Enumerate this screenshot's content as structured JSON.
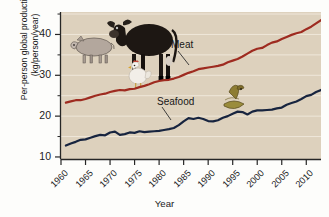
{
  "chart_data": {
    "type": "line",
    "title": "",
    "xlabel": "Year",
    "ylabel": "Per-person global production (kg/person/year)",
    "ylabel_line1": "Per-person global production",
    "ylabel_line2": "(kg/person/year)",
    "xlim": [
      1960,
      2013
    ],
    "ylim": [
      9.5,
      45.5
    ],
    "xticks": [
      1960,
      1965,
      1970,
      1975,
      1980,
      1985,
      1990,
      1995,
      2000,
      2005,
      2010
    ],
    "xtick_labels": [
      "1960",
      "1965",
      "1970",
      "1975",
      "1980",
      "1985",
      "1990",
      "1995",
      "2000",
      "2005",
      "2010"
    ],
    "yticks": [
      10,
      20,
      30,
      40
    ],
    "ytick_labels": [
      "10",
      "20",
      "30",
      "40"
    ],
    "gridlines_y": [
      15,
      20,
      25,
      30,
      35,
      40,
      45
    ],
    "grid": true,
    "legend_position": "inline-annotation",
    "plot_background": "#ddd1bd",
    "gridline_color": "#efe7da",
    "series": [
      {
        "name": "Meat",
        "color": "#9e2b20",
        "label_x": 1987,
        "label_y": 37.5,
        "x": [
          1961,
          1962,
          1963,
          1964,
          1965,
          1966,
          1967,
          1968,
          1969,
          1970,
          1971,
          1972,
          1973,
          1974,
          1975,
          1976,
          1977,
          1978,
          1979,
          1980,
          1981,
          1982,
          1983,
          1984,
          1985,
          1986,
          1987,
          1988,
          1989,
          1990,
          1991,
          1992,
          1993,
          1994,
          1995,
          1996,
          1997,
          1998,
          1999,
          2000,
          2001,
          2002,
          2003,
          2004,
          2005,
          2006,
          2007,
          2008,
          2009,
          2010,
          2011,
          2012,
          2013
        ],
        "values": [
          23.3,
          23.6,
          23.9,
          23.9,
          24.2,
          24.6,
          25.0,
          25.3,
          25.5,
          25.9,
          26.2,
          26.4,
          26.3,
          26.6,
          26.7,
          27.1,
          27.4,
          27.8,
          28.3,
          28.6,
          28.8,
          28.9,
          29.2,
          29.6,
          30.1,
          30.6,
          31.0,
          31.5,
          31.7,
          31.9,
          32.1,
          32.3,
          32.6,
          33.2,
          33.6,
          34.0,
          34.6,
          35.3,
          36.0,
          36.5,
          36.7,
          37.4,
          38.0,
          38.3,
          38.9,
          39.4,
          39.9,
          40.3,
          40.6,
          41.3,
          41.9,
          42.7,
          43.5
        ]
      },
      {
        "name": "Seafood",
        "color": "#17243f",
        "label_x": 1985,
        "label_y": 21.5,
        "x": [
          1961,
          1962,
          1963,
          1964,
          1965,
          1966,
          1967,
          1968,
          1969,
          1970,
          1971,
          1972,
          1973,
          1974,
          1975,
          1976,
          1977,
          1978,
          1979,
          1980,
          1981,
          1982,
          1983,
          1984,
          1985,
          1986,
          1987,
          1988,
          1989,
          1990,
          1991,
          1992,
          1993,
          1994,
          1995,
          1996,
          1997,
          1998,
          1999,
          2000,
          2001,
          2002,
          2003,
          2004,
          2005,
          2006,
          2007,
          2008,
          2009,
          2010,
          2011,
          2012,
          2013
        ],
        "values": [
          12.8,
          13.3,
          13.7,
          14.2,
          14.3,
          14.7,
          15.1,
          15.4,
          15.3,
          16.0,
          16.2,
          15.4,
          15.6,
          16.0,
          15.9,
          16.3,
          16.1,
          16.2,
          16.3,
          16.4,
          16.6,
          16.8,
          17.1,
          17.8,
          18.7,
          19.5,
          19.3,
          19.6,
          19.3,
          18.8,
          18.7,
          19.0,
          19.6,
          20.0,
          20.6,
          21.1,
          21.0,
          20.4,
          21.1,
          21.4,
          21.4,
          21.5,
          21.6,
          21.9,
          22.1,
          22.8,
          23.2,
          23.6,
          24.2,
          24.9,
          25.2,
          25.9,
          26.4
        ]
      }
    ],
    "illustrations": [
      {
        "name": "cow",
        "description": "black cow standing",
        "x": 1967,
        "y": 40.0
      },
      {
        "name": "pig",
        "description": "grey-pink pig standing",
        "x": 1962,
        "y": 36.0
      },
      {
        "name": "chicken",
        "description": "white chicken",
        "x": 1968,
        "y": 33.5
      },
      {
        "name": "fish",
        "description": "olive gold fish",
        "x": 1993,
        "y": 24.5
      }
    ]
  }
}
